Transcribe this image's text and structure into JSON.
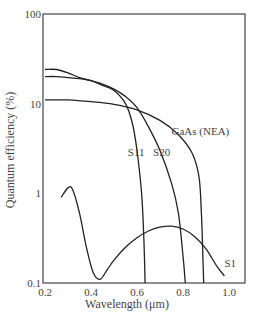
{
  "chart_data": {
    "type": "line",
    "title": "",
    "xlabel": "Wavelength (μm)",
    "ylabel": "Quantum efficiency (%)",
    "xscale": "linear",
    "yscale": "log",
    "xlim": [
      0.2,
      1.06
    ],
    "ylim": [
      0.1,
      100
    ],
    "xticks": [
      0.2,
      0.4,
      0.6,
      0.8,
      1.0
    ],
    "xtick_labels": [
      "0.2",
      "0.4",
      "0.6",
      "0.8",
      "1.0"
    ],
    "yticks": [
      0.1,
      1,
      10,
      100
    ],
    "ytick_labels": [
      "0.1",
      "1",
      "10",
      "100"
    ],
    "grid": false,
    "legend": "inline labels",
    "series": [
      {
        "name": "GaAs (NEA)",
        "label_pos": [
          0.75,
          4.5
        ],
        "x": [
          0.2,
          0.3,
          0.4,
          0.5,
          0.6,
          0.7,
          0.78,
          0.84,
          0.87,
          0.88,
          0.885,
          0.89
        ],
        "y": [
          11,
          11,
          10.5,
          9.8,
          8.5,
          6.5,
          4.5,
          2.8,
          1.5,
          0.6,
          0.25,
          0.1
        ]
      },
      {
        "name": "S11",
        "label_pos": [
          0.56,
          2.6
        ],
        "x": [
          0.2,
          0.25,
          0.3,
          0.35,
          0.4,
          0.45,
          0.5,
          0.55,
          0.58,
          0.6,
          0.62,
          0.63,
          0.635
        ],
        "y": [
          20,
          20,
          19.5,
          19,
          18,
          16,
          14,
          10,
          6,
          3,
          1,
          0.3,
          0.1
        ]
      },
      {
        "name": "S20",
        "label_pos": [
          0.67,
          2.6
        ],
        "x": [
          0.2,
          0.25,
          0.3,
          0.35,
          0.4,
          0.45,
          0.5,
          0.55,
          0.6,
          0.65,
          0.7,
          0.75,
          0.78,
          0.8,
          0.81
        ],
        "y": [
          24,
          24,
          22,
          19.5,
          18,
          16.5,
          14.5,
          12,
          9,
          5.5,
          3,
          1.3,
          0.6,
          0.2,
          0.1
        ]
      },
      {
        "name": "S1",
        "label_pos": [
          0.98,
          0.15
        ],
        "x": [
          0.27,
          0.3,
          0.32,
          0.35,
          0.38,
          0.41,
          0.44,
          0.47,
          0.5,
          0.55,
          0.6,
          0.65,
          0.7,
          0.75,
          0.8,
          0.85,
          0.9,
          0.95,
          0.98
        ],
        "y": [
          0.9,
          1.15,
          1.1,
          0.6,
          0.25,
          0.13,
          0.11,
          0.14,
          0.18,
          0.25,
          0.32,
          0.38,
          0.42,
          0.43,
          0.4,
          0.33,
          0.24,
          0.15,
          0.12
        ]
      }
    ]
  }
}
